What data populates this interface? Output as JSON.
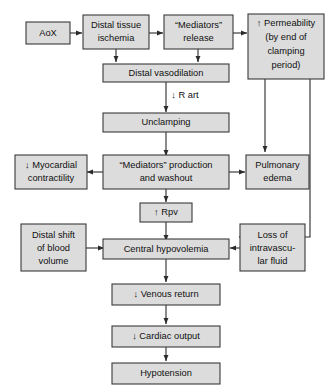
{
  "diagram": {
    "title_fragment": "",
    "colors": {
      "box_fill": "#dcdcdc",
      "box_border": "#3a3a3a",
      "connector": "#2b2b2b",
      "background": "#ffffff"
    },
    "nodes": [
      {
        "id": "aox",
        "label": "AoX",
        "lines": [
          "AoX"
        ]
      },
      {
        "id": "distal-tissue-ischemia",
        "label": "Distal tissue ischemia",
        "lines": [
          "Distal tissue",
          "ischemia"
        ]
      },
      {
        "id": "mediators-release",
        "label": "“Mediators” release",
        "lines": [
          "“Mediators”",
          "release"
        ]
      },
      {
        "id": "permeability",
        "label": "↑ Permeability (by end of clamping period)",
        "lines": [
          "↑ Permeability",
          "(by end of",
          "clamping",
          "period)"
        ]
      },
      {
        "id": "distal-vasodilation",
        "label": "Distal vasodilation",
        "lines": [
          "Distal vasodilation"
        ]
      },
      {
        "id": "unclamping",
        "label": "Unclamping",
        "lines": [
          "Unclamping"
        ]
      },
      {
        "id": "myocardial-contractility",
        "label": "↓ Myocardial contractility",
        "lines": [
          "↓ Myocardial",
          "contractility"
        ]
      },
      {
        "id": "mediators-production",
        "label": "“Mediators” production and washout",
        "lines": [
          "“Mediators” production",
          "and washout"
        ]
      },
      {
        "id": "pulmonary-edema",
        "label": "Pulmonary edema",
        "lines": [
          "Pulmonary",
          "edema"
        ]
      },
      {
        "id": "rpv",
        "label": "↑ Rpv",
        "lines": [
          "↑ Rpv"
        ]
      },
      {
        "id": "distal-shift",
        "label": "Distal shift of blood volume",
        "lines": [
          "Distal shift",
          "of blood",
          "volume"
        ]
      },
      {
        "id": "central-hypovolemia",
        "label": "Central hypovolemia",
        "lines": [
          "Central hypovolemia"
        ]
      },
      {
        "id": "loss-intravascular-fluid",
        "label": "Loss of intravascular fluid",
        "lines": [
          "Loss of",
          "intravascu-",
          "lar fluid"
        ]
      },
      {
        "id": "venous-return",
        "label": "↓ Venous return",
        "lines": [
          "↓ Venous return"
        ]
      },
      {
        "id": "cardiac-output",
        "label": "↓ Cardiac output",
        "lines": [
          "↓ Cardiac output"
        ]
      },
      {
        "id": "hypotension",
        "label": "Hypotension",
        "lines": [
          "Hypotension"
        ]
      }
    ],
    "edge_labels": [
      {
        "id": "r-art",
        "label": "↓ R art"
      }
    ]
  }
}
